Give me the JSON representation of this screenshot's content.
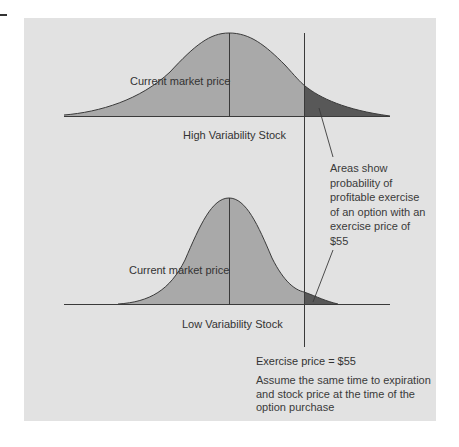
{
  "colors": {
    "panel": "#e2e2e2",
    "distribution_fill": "#a9a9a9",
    "profitable_area_fill": "#585858",
    "line": "#3a3a3a"
  },
  "upper_distribution": {
    "market_price_label": "Current market price",
    "caption": "High Variability Stock"
  },
  "lower_distribution": {
    "market_price_label": "Current market price",
    "caption": "Low Variability Stock"
  },
  "annotation": {
    "lines": [
      "Areas show",
      "probability of",
      "profitable exercise",
      "of an option with an",
      "exercise price of",
      "$55"
    ]
  },
  "exercise_price_label": "Exercise price = $55",
  "assumption_note": {
    "lines": [
      "Assume the same time to expiration",
      "and stock price at the time of the",
      "option purchase"
    ]
  }
}
